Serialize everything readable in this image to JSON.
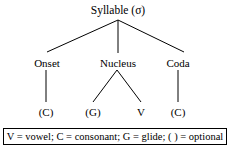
{
  "diagram": {
    "root": {
      "label": "Syllable (σ)"
    },
    "level2": [
      {
        "label": "Onset"
      },
      {
        "label": "Nucleus"
      },
      {
        "label": "Coda"
      }
    ],
    "terminals": [
      {
        "label": "(C)"
      },
      {
        "label": "(G)"
      },
      {
        "label": "V"
      },
      {
        "label": "(C)"
      }
    ],
    "legend": {
      "text": "V = vowel; C = consonant; G = glide; (  ) = optional"
    },
    "colors": {
      "line": "#000000",
      "text": "#000000",
      "background": "#ffffff",
      "border": "#000000"
    }
  }
}
